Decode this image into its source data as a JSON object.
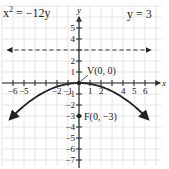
{
  "chart_data": {
    "type": "line",
    "title": "",
    "equation_label": "x² = −12y",
    "directrix_label": "y = 3",
    "vertex_label": "V(0, 0)",
    "focus_label": "F(0, −3)",
    "xlabel": "x",
    "ylabel": "y",
    "xlim": [
      -6.8,
      6.9
    ],
    "ylim": [
      -7.3,
      6.5
    ],
    "grid": true,
    "x_ticks": [
      -6,
      -5,
      -2,
      -1,
      1,
      2,
      4,
      5,
      6
    ],
    "y_ticks": [
      5,
      4,
      2,
      1,
      -1,
      -2,
      -3,
      -4,
      -5,
      -6,
      -7
    ],
    "series": [
      {
        "name": "parabola x^2 = -12y",
        "style": "solid",
        "arrows": "both",
        "x": [
          -6.3,
          -6,
          -5,
          -4,
          -3,
          -2,
          -1,
          0,
          1,
          2,
          3,
          4,
          5,
          6,
          6.3
        ],
        "y": [
          -3.31,
          -3,
          -2.08,
          -1.33,
          -0.75,
          -0.33,
          -0.08,
          0,
          -0.08,
          -0.33,
          -0.75,
          -1.33,
          -2.08,
          -3,
          -3.31
        ]
      },
      {
        "name": "directrix y = 3",
        "style": "dashed",
        "arrows": "both",
        "x": [
          -6.5,
          6.5
        ],
        "y": [
          3,
          3
        ]
      }
    ],
    "points": [
      {
        "label": "V(0, 0)",
        "x": 0,
        "y": 0
      },
      {
        "label": "F(0, −3)",
        "x": 0,
        "y": -3
      }
    ]
  }
}
